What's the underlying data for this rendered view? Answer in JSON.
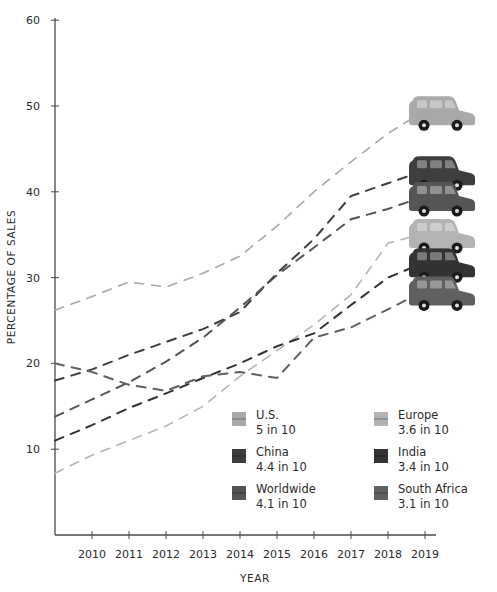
{
  "chart_data": {
    "type": "line",
    "title": "",
    "xlabel": "YEAR",
    "ylabel": "PERCENTAGE OF SALES",
    "x": [
      2009,
      2010,
      2011,
      2012,
      2013,
      2014,
      2015,
      2016,
      2017,
      2018,
      2019
    ],
    "x_tick_labels": [
      "2010",
      "2011",
      "2012",
      "2013",
      "2014",
      "2015",
      "2016",
      "2017",
      "2018",
      "2019"
    ],
    "y_tick_labels": [
      "10",
      "20",
      "30",
      "40",
      "50",
      "60"
    ],
    "ylim": [
      0,
      60
    ],
    "grid": false,
    "legend_position": "lower right (inside plot)",
    "line_style": "dashed",
    "series": [
      {
        "name": "U.S.",
        "label": "5 in 10",
        "color": "#a9a9a9",
        "values": [
          26.2,
          27.8,
          29.5,
          28.9,
          30.5,
          32.5,
          36.0,
          40.0,
          43.5,
          46.8,
          49.5
        ]
      },
      {
        "name": "China",
        "label": "4.4 in 10",
        "color": "#3e3e3e",
        "values": [
          18.0,
          19.3,
          21.0,
          22.5,
          24.0,
          26.0,
          30.5,
          34.5,
          39.5,
          41.0,
          42.5
        ]
      },
      {
        "name": "Worldwide",
        "label": "4.1 in 10",
        "color": "#555555",
        "values": [
          13.8,
          15.8,
          17.8,
          20.2,
          23.0,
          26.5,
          30.3,
          33.5,
          36.8,
          38.0,
          39.5
        ]
      },
      {
        "name": "Europe",
        "label": "3.6 in 10",
        "color": "#b3b3b3",
        "values": [
          7.2,
          9.3,
          11.0,
          12.7,
          15.0,
          18.5,
          21.5,
          24.5,
          28.0,
          34.0,
          35.2
        ]
      },
      {
        "name": "India",
        "label": "3.4 in 10",
        "color": "#333333",
        "values": [
          11.0,
          12.8,
          14.8,
          16.5,
          18.3,
          20.0,
          22.0,
          23.5,
          26.8,
          30.0,
          31.8
        ]
      },
      {
        "name": "South Africa",
        "label": "3.1 in 10",
        "color": "#606060",
        "values": [
          20.0,
          19.0,
          17.5,
          16.8,
          18.5,
          19.0,
          18.3,
          23.0,
          24.2,
          26.3,
          28.5
        ]
      }
    ],
    "annotations": [
      "car illustration at end of each series line"
    ]
  },
  "legend": {
    "items": [
      {
        "name": "U.S.",
        "value": "5 in 10",
        "color": "#a9a9a9"
      },
      {
        "name": "Europe",
        "value": "3.6 in 10",
        "color": "#b3b3b3"
      },
      {
        "name": "China",
        "value": "4.4 in 10",
        "color": "#3e3e3e"
      },
      {
        "name": "India",
        "value": "3.4 in 10",
        "color": "#333333"
      },
      {
        "name": "Worldwide",
        "value": "4.1 in 10",
        "color": "#555555"
      },
      {
        "name": "South Africa",
        "value": "3.1 in 10",
        "color": "#606060"
      }
    ]
  },
  "icons": {
    "series_end_marker": "car-icon"
  }
}
